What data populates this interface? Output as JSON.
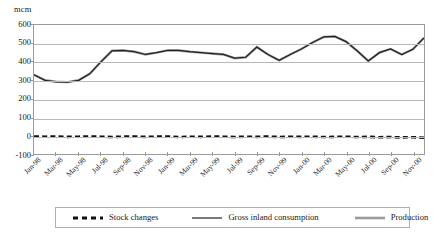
{
  "chart": {
    "unit_label": "mcm",
    "y_ticks": [
      "600",
      "500",
      "400",
      "300",
      "200",
      "100",
      "0",
      "-100"
    ],
    "x_tick_labels": [
      "Jan-98",
      "Mar-98",
      "May-98",
      "Jul-98",
      "Sep-98",
      "Nov-98",
      "Jan-99",
      "Mar-99",
      "May-99",
      "Jul-99",
      "Sep-99",
      "Nov-99",
      "Jan-00",
      "Mar-00",
      "May-00",
      "Jul-00",
      "Sep-00",
      "Nov-00"
    ],
    "legend": [
      {
        "label": "Stock changes",
        "style": "dashed",
        "color": "#111111"
      },
      {
        "label": "Gross inland consumption",
        "style": "solid-thin",
        "color": "#222222"
      },
      {
        "label": "Production",
        "style": "solid-thick",
        "color": "#9b9b9b"
      }
    ]
  },
  "chart_data": {
    "type": "line",
    "title": "",
    "xlabel": "",
    "ylabel": "mcm",
    "ylim": [
      -100,
      600
    ],
    "ytick_step": 100,
    "grid": true,
    "legend_position": "bottom",
    "x": [
      "Jan-98",
      "Feb-98",
      "Mar-98",
      "Apr-98",
      "May-98",
      "Jun-98",
      "Jul-98",
      "Aug-98",
      "Sep-98",
      "Oct-98",
      "Nov-98",
      "Dec-98",
      "Jan-99",
      "Feb-99",
      "Mar-99",
      "Apr-99",
      "May-99",
      "Jun-99",
      "Jul-99",
      "Aug-99",
      "Sep-99",
      "Oct-99",
      "Nov-99",
      "Dec-99",
      "Jan-00",
      "Feb-00",
      "Mar-00",
      "Apr-00",
      "May-00",
      "Jun-00",
      "Jul-00",
      "Aug-00",
      "Sep-00",
      "Oct-00",
      "Nov-00",
      "Dec-00"
    ],
    "x_tick_labels": [
      "Jan-98",
      "Mar-98",
      "May-98",
      "Jul-98",
      "Sep-98",
      "Nov-98",
      "Jan-99",
      "Mar-99",
      "May-99",
      "Jul-99",
      "Sep-99",
      "Nov-99",
      "Jan-00",
      "Mar-00",
      "May-00",
      "Jul-00",
      "Sep-00",
      "Nov-00"
    ],
    "series": [
      {
        "name": "Gross inland consumption",
        "color": "#222222",
        "style": "solid-thin",
        "values": [
          330,
          300,
          292,
          290,
          300,
          335,
          400,
          460,
          462,
          455,
          440,
          450,
          462,
          462,
          455,
          450,
          445,
          440,
          420,
          425,
          480,
          440,
          408,
          440,
          470,
          505,
          535,
          538,
          510,
          460,
          405,
          450,
          470,
          440,
          468,
          530
        ]
      },
      {
        "name": "Production",
        "color": "#9b9b9b",
        "style": "solid-thick",
        "values": [
          330,
          300,
          292,
          290,
          300,
          335,
          400,
          460,
          462,
          455,
          440,
          450,
          462,
          462,
          455,
          450,
          445,
          440,
          420,
          425,
          480,
          440,
          408,
          440,
          470,
          505,
          535,
          538,
          510,
          460,
          405,
          450,
          470,
          440,
          468,
          530
        ]
      },
      {
        "name": "Stock changes",
        "color": "#111111",
        "style": "dashed",
        "values": [
          -5,
          -6,
          -5,
          -7,
          -6,
          -5,
          -6,
          -8,
          -6,
          -5,
          -7,
          -6,
          -5,
          -8,
          -6,
          -7,
          -5,
          -6,
          -8,
          -6,
          -7,
          -5,
          -8,
          -6,
          -7,
          -6,
          -8,
          -7,
          -6,
          -8,
          -7,
          -9,
          -8,
          -10,
          -9,
          -12
        ]
      }
    ],
    "series_tail": {
      "comment_values": [
        545,
        555,
        552,
        530,
        500,
        470,
        462,
        468,
        480
      ]
    }
  }
}
